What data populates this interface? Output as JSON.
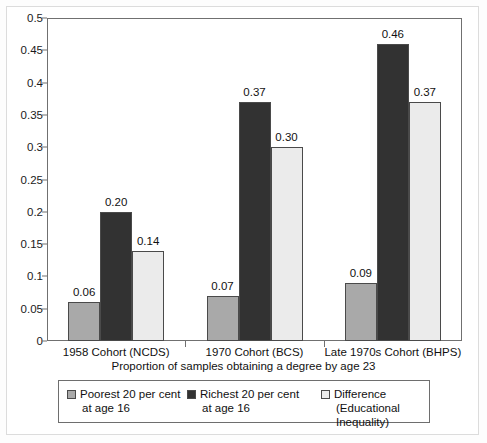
{
  "chart_data": {
    "type": "bar",
    "title": "",
    "xlabel": "Proportion of samples obtaining a degree by age 23",
    "ylabel": "",
    "ylim": [
      0,
      0.5
    ],
    "grid": false,
    "legend_position": "bottom",
    "categories": [
      "1958 Cohort (NCDS)",
      "1970 Cohort (BCS)",
      "Late 1970s Cohort (BHPS)"
    ],
    "yticks": [
      "0",
      "0.05",
      "0.1",
      "0.15",
      "0.2",
      "0.25",
      "0.3",
      "0.35",
      "0.4",
      "0.45",
      "0.5"
    ],
    "ytick_values": [
      0,
      0.05,
      0.1,
      0.15,
      0.2,
      0.25,
      0.3,
      0.35,
      0.4,
      0.45,
      0.5
    ],
    "series": [
      {
        "name": "Poorest 20 per cent at age 16",
        "legend_line1": "Poorest 20 per cent",
        "legend_line2": "at age 16",
        "color": "#a9a9a9",
        "values": [
          0.06,
          0.07,
          0.09
        ],
        "labels": [
          "0.06",
          "0.07",
          "0.09"
        ]
      },
      {
        "name": "Richest 20 per cent at age 16",
        "legend_line1": "Richest 20 per cent",
        "legend_line2": "at age 16",
        "color": "#323232",
        "values": [
          0.2,
          0.37,
          0.46
        ],
        "labels": [
          "0.20",
          "0.37",
          "0.46"
        ]
      },
      {
        "name": "Difference (Educational Inequality)",
        "legend_line1": "Difference",
        "legend_line2": "(Educational Inequality)",
        "color": "#ebebeb",
        "values": [
          0.14,
          0.3,
          0.37
        ],
        "labels": [
          "0.14",
          "0.30",
          "0.37"
        ]
      }
    ]
  }
}
